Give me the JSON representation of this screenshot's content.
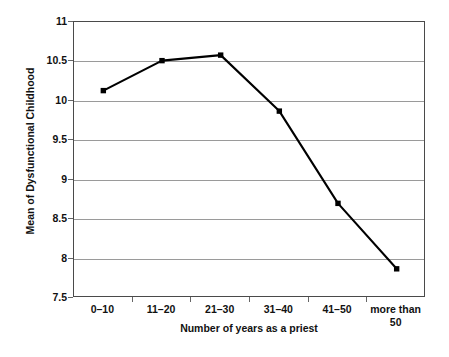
{
  "chart_data": {
    "type": "line",
    "title": "",
    "xlabel": "Number of years as a priest",
    "ylabel": "Mean of Dysfunctional Childhood",
    "categories": [
      "0–10",
      "11–20",
      "21–30",
      "31–40",
      "41–50",
      "more than\n50"
    ],
    "values": [
      10.13,
      10.51,
      10.58,
      9.87,
      8.7,
      7.87
    ],
    "series": [
      {
        "name": "Mean of Dysfunctional Childhood",
        "values": [
          10.13,
          10.51,
          10.58,
          9.87,
          8.7,
          7.87
        ]
      }
    ],
    "ylim": [
      7.5,
      11
    ],
    "yticks": [
      7.5,
      8,
      8.5,
      9,
      9.5,
      10,
      10.5,
      11
    ],
    "ytick_labels": [
      "7.5",
      "8",
      "8.5",
      "9",
      "9.5",
      "10",
      "10.5",
      "11"
    ],
    "grid": true,
    "grid_axis": "y",
    "legend": false,
    "legend_position": "none",
    "marker": "square",
    "line_color": "#000000",
    "marker_color": "#000000",
    "grid_color": "#9a9a9a",
    "axis_color": "#4a4a4a",
    "background_color": "#ffffff"
  }
}
